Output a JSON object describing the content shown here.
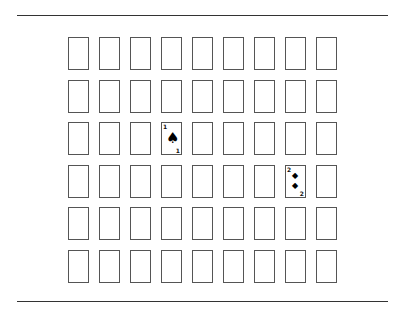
{
  "board": {
    "rows": 6,
    "columns": 9,
    "face_up_cards": [
      {
        "row": 2,
        "col": 3,
        "rank": "1",
        "suit": "spade",
        "pips": [
          "♠"
        ]
      },
      {
        "row": 3,
        "col": 7,
        "rank": "2",
        "suit": "diamond",
        "pips": [
          "◆",
          "◆"
        ]
      }
    ]
  }
}
